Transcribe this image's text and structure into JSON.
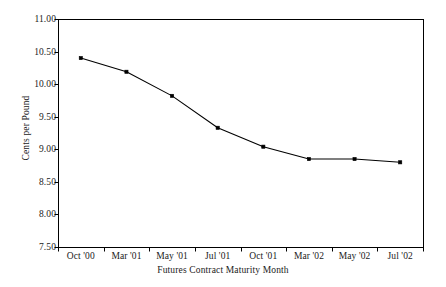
{
  "chart_data": {
    "type": "line",
    "title": "",
    "xlabel": "Futures Contract Maturity Month",
    "ylabel": "Cents per Pound",
    "categories": [
      "Oct '00",
      "Mar '01",
      "May '01",
      "Jul '01",
      "Oct '01",
      "Mar '02",
      "May '02",
      "Jul '02"
    ],
    "values": [
      10.4,
      10.19,
      9.82,
      9.33,
      9.04,
      8.85,
      8.85,
      8.8
    ],
    "series": [
      {
        "name": "Futures price",
        "values": [
          10.4,
          10.19,
          9.82,
          9.33,
          9.04,
          8.85,
          8.85,
          8.8
        ]
      }
    ],
    "ylim": [
      7.5,
      11.0
    ],
    "ytick_labels": [
      "11.00",
      "10.50",
      "10.00",
      "9.50",
      "9.00",
      "8.50",
      "8.00",
      "7.50"
    ],
    "ytick_values": [
      11.0,
      10.5,
      10.0,
      9.5,
      9.0,
      8.5,
      8.0,
      7.5
    ],
    "grid": false,
    "legend": "none",
    "marker": "square",
    "line_color": "#000000",
    "marker_color": "#000000",
    "axis_color": "#000000",
    "background_color": "#ffffff"
  }
}
